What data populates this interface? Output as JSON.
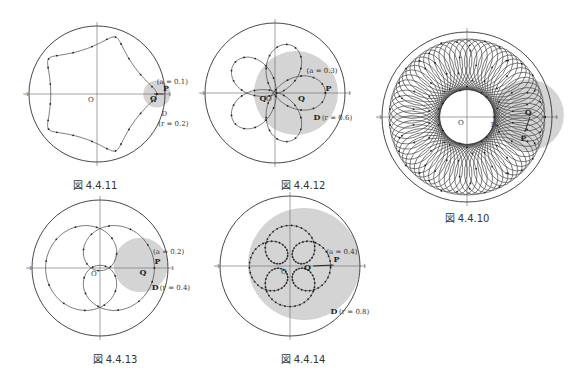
{
  "figures": [
    {
      "id": "fig-4-4-11",
      "caption": "図 4.4.11",
      "cx": 97,
      "cy": 94,
      "R": 68,
      "disk_r": 0.2,
      "a": 0.1,
      "labels": {
        "a": "(a = 0.1)",
        "D": "D",
        "r": "(r = 0.2)",
        "P": "P",
        "Q": "Q",
        "O": "O"
      }
    },
    {
      "id": "fig-4-4-12",
      "caption": "図 4.4.12",
      "cx": 275,
      "cy": 93,
      "R": 70,
      "disk_r": 0.6,
      "a": 0.3,
      "labels": {
        "a": "(a = 0.3)",
        "D": "D",
        "r": "(r = 0.6)",
        "P": "P",
        "Q": "Q",
        "O": "O"
      }
    },
    {
      "id": "fig-4-4-10",
      "caption": "図 4.4.10",
      "cx": 467,
      "cy": 117,
      "R": 85,
      "labels": {
        "D": "D",
        "P": "P",
        "Q": "Q",
        "O": "O"
      }
    },
    {
      "id": "fig-4-4-13",
      "caption": "図 4.4.13",
      "cx": 100,
      "cy": 268,
      "R": 68,
      "disk_r": 0.4,
      "a": 0.2,
      "labels": {
        "a": "(a = 0.2)",
        "D": "D",
        "r": "(r = 0.4)",
        "P": "P",
        "Q": "Q",
        "O": "O"
      }
    },
    {
      "id": "fig-4-4-14",
      "caption": "図 4.4.14",
      "cx": 290,
      "cy": 266,
      "R": 70,
      "disk_r": 0.8,
      "a": 0.4,
      "labels": {
        "a": "(a = 0.4)",
        "D": "D",
        "r": "(r = 0.8)",
        "P": "P",
        "Q": "Q",
        "O": "O"
      }
    }
  ],
  "ticks": {
    "one": "1",
    "neg_one": "-1"
  },
  "colors": {
    "disk": "#d4d4d4",
    "curve": "#444",
    "circle": "#333",
    "axis": "#666"
  }
}
